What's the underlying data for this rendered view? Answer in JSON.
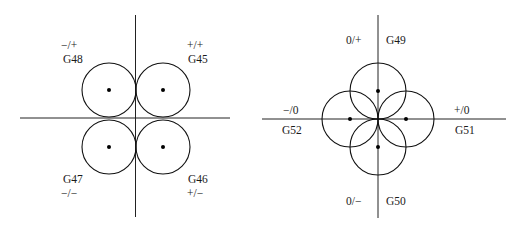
{
  "left_diagram": {
    "title": "Corner offset quadrants",
    "quadrants": [
      {
        "code": "G48",
        "sign": "−/+",
        "position": "upper-left"
      },
      {
        "code": "G45",
        "sign": "+/+",
        "position": "upper-right"
      },
      {
        "code": "G47",
        "sign": "−/−",
        "position": "lower-left"
      },
      {
        "code": "G46",
        "sign": "+/−",
        "position": "lower-right"
      }
    ]
  },
  "right_diagram": {
    "title": "Axis offset directions",
    "directions": [
      {
        "code": "G49",
        "sign": "0/+",
        "position": "up"
      },
      {
        "code": "G50",
        "sign": "0/−",
        "position": "down"
      },
      {
        "code": "G51",
        "sign": "+/0",
        "position": "right"
      },
      {
        "code": "G52",
        "sign": "−/0",
        "position": "left"
      }
    ]
  },
  "colors": {
    "line": "#222222",
    "background": "#ffffff"
  }
}
